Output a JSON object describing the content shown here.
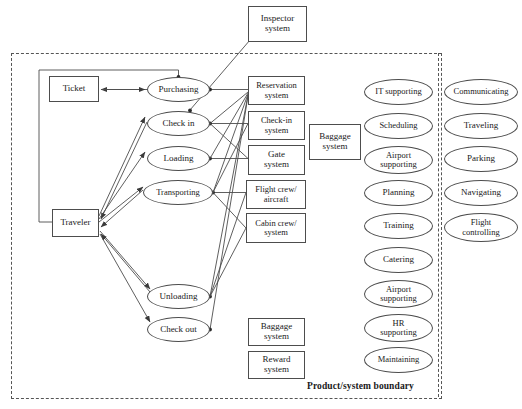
{
  "diagram": {
    "boundary_label": "Product/system boundary",
    "external_actors": [
      {
        "id": "inspector-system",
        "label": "Inspector\nsystem",
        "shape": "box",
        "x": 248,
        "y": 6,
        "w": 59,
        "h": 36
      }
    ],
    "actor_boxes": [
      {
        "id": "ticket",
        "label": "Ticket",
        "shape": "box",
        "x": 49,
        "y": 76,
        "w": 50,
        "h": 26
      },
      {
        "id": "traveler",
        "label": "Traveler",
        "shape": "box",
        "x": 52,
        "y": 209,
        "w": 47,
        "h": 28
      }
    ],
    "processes": [
      {
        "id": "purchasing",
        "label": "Purchasing",
        "shape": "ellipse",
        "x": 147,
        "y": 77,
        "w": 63,
        "h": 25
      },
      {
        "id": "check-in",
        "label": "Check in",
        "shape": "ellipse",
        "x": 147,
        "y": 111,
        "w": 63,
        "h": 25
      },
      {
        "id": "loading",
        "label": "Loading",
        "shape": "ellipse",
        "x": 147,
        "y": 146,
        "w": 63,
        "h": 25
      },
      {
        "id": "transporting",
        "label": "Transporting",
        "shape": "ellipse",
        "x": 143,
        "y": 180,
        "w": 70,
        "h": 25
      },
      {
        "id": "unloading",
        "label": "Unloading",
        "shape": "ellipse",
        "x": 147,
        "y": 284,
        "w": 63,
        "h": 25
      },
      {
        "id": "check-out",
        "label": "Check out",
        "shape": "ellipse",
        "x": 147,
        "y": 317,
        "w": 63,
        "h": 25
      }
    ],
    "systems_column": [
      {
        "id": "reservation-system",
        "label": "Reservation\nsystem",
        "shape": "box",
        "x": 248,
        "y": 76,
        "w": 57,
        "h": 29
      },
      {
        "id": "check-in-system",
        "label": "Check-in\nsystem",
        "shape": "box",
        "x": 248,
        "y": 111,
        "w": 57,
        "h": 29
      },
      {
        "id": "gate-system",
        "label": "Gate\nsystem",
        "shape": "box",
        "x": 248,
        "y": 145,
        "w": 57,
        "h": 30
      },
      {
        "id": "flight-crew-aircraft",
        "label": "Flight crew/\naircraft",
        "shape": "box",
        "x": 246,
        "y": 180,
        "w": 60,
        "h": 29
      },
      {
        "id": "cabin-crew-system",
        "label": "Cabin crew/\nsystem",
        "shape": "box",
        "x": 246,
        "y": 213,
        "w": 60,
        "h": 30
      },
      {
        "id": "baggage-system-lower",
        "label": "Baggage\nsystem",
        "shape": "box",
        "x": 248,
        "y": 318,
        "w": 57,
        "h": 28
      },
      {
        "id": "reward-system",
        "label": "Reward\nsystem",
        "shape": "box",
        "x": 248,
        "y": 351,
        "w": 57,
        "h": 28
      }
    ],
    "baggage_system": {
      "id": "baggage-system",
      "label": "Baggage\nsystem",
      "shape": "box",
      "x": 309,
      "y": 124,
      "w": 52,
      "h": 36
    },
    "support_functions": [
      {
        "id": "it-supporting",
        "label": "IT supporting",
        "shape": "ellipse",
        "x": 364,
        "y": 79,
        "w": 69,
        "h": 26
      },
      {
        "id": "scheduling",
        "label": "Scheduling",
        "shape": "ellipse",
        "x": 364,
        "y": 113,
        "w": 69,
        "h": 26
      },
      {
        "id": "airport-supporting-1",
        "label": "Airport\nsupporting",
        "shape": "ellipse",
        "x": 364,
        "y": 146,
        "w": 69,
        "h": 28
      },
      {
        "id": "planning",
        "label": "Planning",
        "shape": "ellipse",
        "x": 364,
        "y": 180,
        "w": 69,
        "h": 26
      },
      {
        "id": "training",
        "label": "Training",
        "shape": "ellipse",
        "x": 364,
        "y": 213,
        "w": 69,
        "h": 26
      },
      {
        "id": "catering",
        "label": "Catering",
        "shape": "ellipse",
        "x": 364,
        "y": 247,
        "w": 69,
        "h": 26
      },
      {
        "id": "airport-supporting-2",
        "label": "Airport\nsupporting",
        "shape": "ellipse",
        "x": 364,
        "y": 280,
        "w": 69,
        "h": 28
      },
      {
        "id": "hr-supporting",
        "label": "HR\nsupporting",
        "shape": "ellipse",
        "x": 364,
        "y": 314,
        "w": 69,
        "h": 28
      },
      {
        "id": "maintaining",
        "label": "Maintaining",
        "shape": "ellipse",
        "x": 364,
        "y": 347,
        "w": 69,
        "h": 26
      }
    ],
    "external_functions": [
      {
        "id": "communicating",
        "label": "Communicating",
        "shape": "ellipse",
        "x": 444,
        "y": 79,
        "w": 74,
        "h": 26
      },
      {
        "id": "traveling",
        "label": "Traveling",
        "shape": "ellipse",
        "x": 444,
        "y": 113,
        "w": 74,
        "h": 26
      },
      {
        "id": "parking",
        "label": "Parking",
        "shape": "ellipse",
        "x": 444,
        "y": 146,
        "w": 74,
        "h": 26
      },
      {
        "id": "navigating",
        "label": "Navigating",
        "shape": "ellipse",
        "x": 444,
        "y": 180,
        "w": 74,
        "h": 26
      },
      {
        "id": "flight-controlling",
        "label": "Flight\ncontrolling",
        "shape": "ellipse",
        "x": 444,
        "y": 213,
        "w": 74,
        "h": 29
      }
    ],
    "boundary_rect": {
      "x": 11,
      "y": 53,
      "w": 429,
      "h": 344
    },
    "inner_divider": {
      "x": 438,
      "y": 53,
      "h": 344
    },
    "colors": {
      "line": "#4d4d4d",
      "dashed": "#555555",
      "text": "#1a1a1a",
      "background": "#ffffff"
    }
  }
}
